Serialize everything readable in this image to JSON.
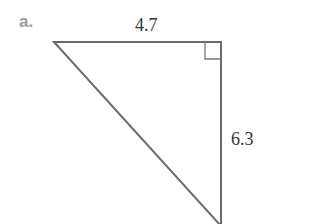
{
  "problem": {
    "label": "a."
  },
  "triangle": {
    "type": "right-triangle",
    "right_angle_vertex": "top-right",
    "sides": {
      "top": "4.7",
      "right": "6.3"
    },
    "stroke_color": "#6b6b6b"
  }
}
